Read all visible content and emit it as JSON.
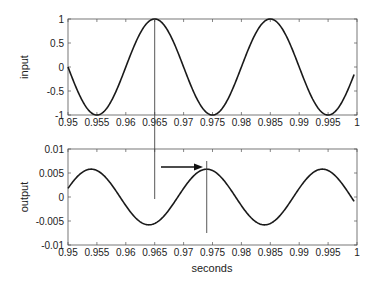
{
  "chart_data": [
    {
      "type": "line",
      "title": "",
      "xlabel": "",
      "ylabel": "input",
      "xlim": [
        0.95,
        1.0
      ],
      "ylim": [
        -1,
        1
      ],
      "x_ticks": [
        "0.95",
        "0.955",
        "0.96",
        "0.965",
        "0.97",
        "0.975",
        "0.98",
        "0.985",
        "0.99",
        "0.995",
        "1"
      ],
      "y_ticks": [
        "-1",
        "-0.5",
        "0",
        "0.5",
        "1"
      ],
      "grid": false,
      "series": [
        {
          "name": "input",
          "function": "cos(2*pi*50*(t-0.965))",
          "amplitude": 1,
          "frequency_hz": 50,
          "peaks_at": [
            0.965,
            0.985
          ],
          "troughs_at": [
            0.955,
            0.975,
            0.995
          ],
          "x": [
            0.95,
            0.9525,
            0.955,
            0.9575,
            0.96,
            0.9625,
            0.965,
            0.9675,
            0.97,
            0.9725,
            0.975,
            0.9775,
            0.98,
            0.9825,
            0.985,
            0.9875,
            0.99,
            0.9925,
            0.995,
            0.9975,
            0.999
          ],
          "values": [
            0,
            -0.707,
            -1,
            -0.707,
            0,
            0.707,
            1,
            0.707,
            0,
            -0.707,
            -1,
            -0.707,
            0,
            0.707,
            1,
            0.707,
            0,
            -0.707,
            -1,
            -0.707,
            -0.309
          ]
        }
      ],
      "annotations": [
        {
          "type": "vertical-line",
          "x": 0.965,
          "note": "marks input peak, extends down into output plot"
        }
      ]
    },
    {
      "type": "line",
      "title": "",
      "xlabel": "seconds",
      "ylabel": "output",
      "xlim": [
        0.95,
        1.0
      ],
      "ylim": [
        -0.01,
        0.01
      ],
      "x_ticks": [
        "0.95",
        "0.955",
        "0.96",
        "0.965",
        "0.97",
        "0.975",
        "0.98",
        "0.985",
        "0.99",
        "0.995",
        "1"
      ],
      "y_ticks": [
        "-0.01",
        "-0.005",
        "0",
        "0.005",
        "0.01"
      ],
      "grid": false,
      "series": [
        {
          "name": "output",
          "function": "0.0058*cos(2*pi*50*(t-0.974))",
          "amplitude": 0.0058,
          "frequency_hz": 50,
          "peaks_at": [
            0.954,
            0.974,
            0.994
          ],
          "troughs_at": [
            0.964,
            0.984
          ],
          "x": [
            0.95,
            0.954,
            0.959,
            0.964,
            0.969,
            0.974,
            0.979,
            0.984,
            0.989,
            0.994,
            0.999
          ],
          "values": [
            0.0018,
            0.0058,
            0,
            -0.0058,
            0,
            0.0058,
            0,
            -0.0058,
            0,
            0.0058,
            -0.0003
          ]
        }
      ],
      "annotations": [
        {
          "type": "arrow",
          "from_x": 0.966,
          "to_x": 0.973,
          "y": 0.0075,
          "note": "phase delay from input peak to output peak"
        },
        {
          "type": "vertical-line",
          "x": 0.974,
          "note": "marks output peak"
        }
      ]
    }
  ],
  "labels": {
    "top_ylabel": "input",
    "bottom_ylabel": "output",
    "xlabel": "seconds"
  }
}
